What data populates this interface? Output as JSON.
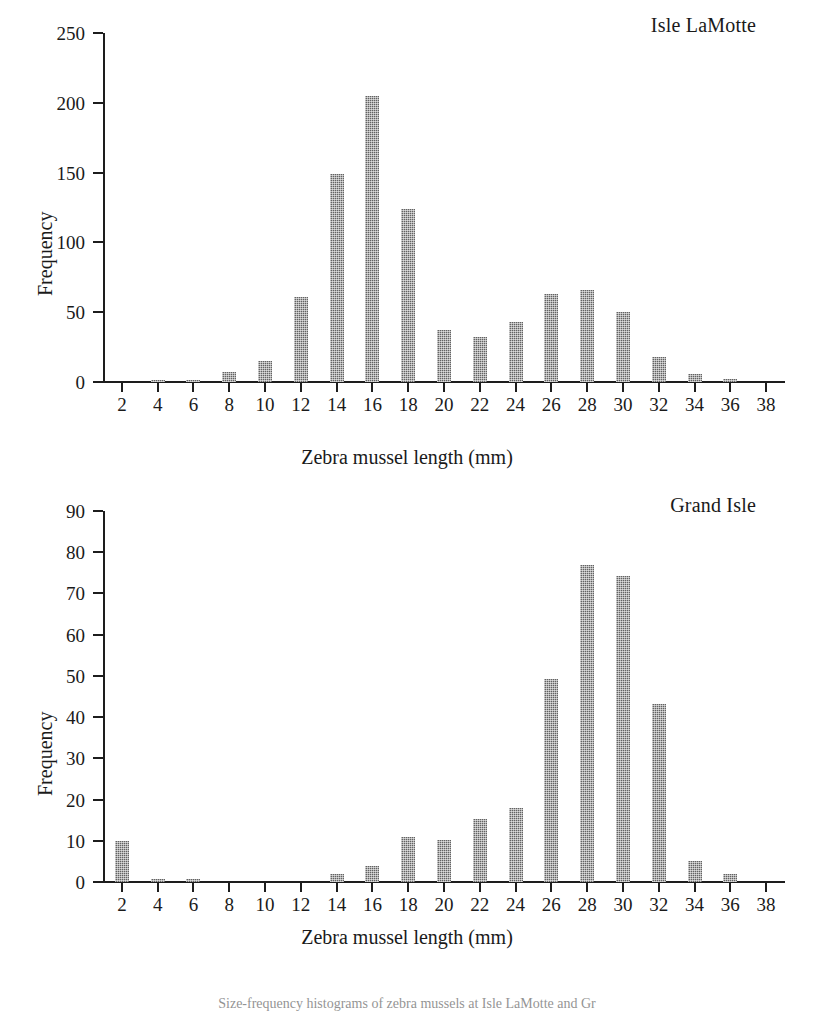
{
  "figure": {
    "xlabel": "Zebra mussel length (mm)",
    "ylabel": "Frequency",
    "bar_color": "#8e8e8e",
    "axis_color": "#1d1d1d",
    "caption_partial": "Size-frequency histograms of zebra mussels at Isle LaMotte and Gr"
  },
  "panels": [
    {
      "id": "top",
      "title": "Isle LaMotte"
    },
    {
      "id": "bottom",
      "title": "Grand Isle"
    }
  ],
  "chart_data": [
    {
      "type": "bar",
      "title": "Isle LaMotte",
      "xlabel": "Zebra mussel length (mm)",
      "ylabel": "Frequency",
      "categories": [
        2,
        4,
        6,
        8,
        10,
        12,
        14,
        16,
        18,
        20,
        22,
        24,
        26,
        28,
        30,
        32,
        34,
        36,
        38
      ],
      "values": [
        0,
        1,
        1,
        7,
        15,
        61,
        149,
        205,
        124,
        37,
        32,
        43,
        63,
        66,
        50,
        18,
        6,
        2,
        0
      ],
      "xlim": [
        1,
        39
      ],
      "ylim": [
        0,
        250
      ],
      "yticks": [
        0,
        50,
        100,
        150,
        200,
        250
      ],
      "xticks": [
        2,
        4,
        6,
        8,
        10,
        12,
        14,
        16,
        18,
        20,
        22,
        24,
        26,
        28,
        30,
        32,
        34,
        36,
        38
      ],
      "grid": false,
      "legend": "none"
    },
    {
      "type": "bar",
      "title": "Grand Isle",
      "xlabel": "Zebra mussel length (mm)",
      "ylabel": "Frequency",
      "categories": [
        2,
        4,
        6,
        8,
        10,
        12,
        14,
        16,
        18,
        20,
        22,
        24,
        26,
        28,
        30,
        32,
        34,
        36,
        38
      ],
      "values": [
        10,
        0.8,
        0.8,
        0,
        0,
        0,
        2,
        4,
        11,
        10.2,
        15.2,
        18,
        49.2,
        77,
        74.2,
        43.2,
        5,
        2,
        0
      ],
      "xlim": [
        1,
        39
      ],
      "ylim": [
        0,
        90
      ],
      "yticks": [
        0,
        10,
        20,
        30,
        40,
        50,
        60,
        70,
        80,
        90
      ],
      "xticks": [
        2,
        4,
        6,
        8,
        10,
        12,
        14,
        16,
        18,
        20,
        22,
        24,
        26,
        28,
        30,
        32,
        34,
        36,
        38
      ],
      "grid": false,
      "legend": "none"
    }
  ]
}
